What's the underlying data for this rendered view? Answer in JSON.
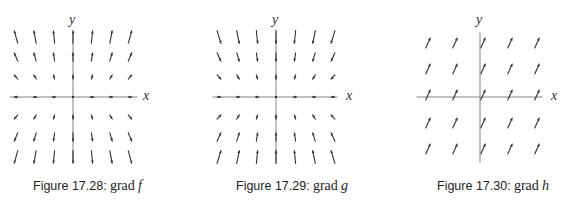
{
  "figures": [
    {
      "id": "17.28",
      "caption_label": "Figure 17.28:",
      "caption_fn": "grad",
      "caption_var": "f",
      "x_axis_label": "x",
      "y_axis_label": "y",
      "field": "outward-from-x-axis",
      "grid": {
        "cols": 7,
        "rows": 7
      }
    },
    {
      "id": "17.29",
      "caption_label": "Figure 17.29:",
      "caption_fn": "grad",
      "caption_var": "g",
      "x_axis_label": "x",
      "y_axis_label": "y",
      "field": "inward-toward-x-axis",
      "grid": {
        "cols": 7,
        "rows": 7
      }
    },
    {
      "id": "17.30",
      "caption_label": "Figure 17.30:",
      "caption_fn": "grad",
      "caption_var": "h",
      "x_axis_label": "x",
      "y_axis_label": "y",
      "field": "constant-up-right",
      "grid": {
        "cols": 5,
        "rows": 5
      }
    }
  ],
  "colors": {
    "axis": "#777777",
    "arrow": "#333333",
    "text": "#222222"
  }
}
